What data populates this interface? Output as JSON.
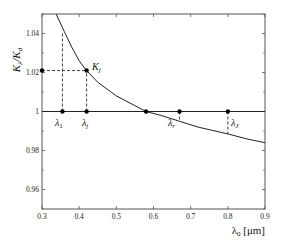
{
  "chart_data": {
    "type": "line",
    "title": "",
    "xlabel": "λ0 [μm]",
    "ylabel": "Kλ/Kd",
    "xlim": [
      0.3,
      0.9
    ],
    "ylim": [
      0.95,
      1.05
    ],
    "grid": false,
    "legend": null,
    "xticks": [
      0.3,
      0.4,
      0.5,
      0.6,
      0.7,
      0.8,
      0.9
    ],
    "xtick_labels": [
      "0.3",
      "0.4",
      "0.5",
      "0.6",
      "0.7",
      "0.8",
      "0.9"
    ],
    "yticks": [
      0.96,
      0.98,
      1.0,
      1.02,
      1.04
    ],
    "ytick_labels": [
      "0.96",
      "0.98",
      "1",
      "1.02",
      "1.04"
    ],
    "series": [
      {
        "name": "Kλ/Kd curve",
        "x": [
          0.338,
          0.36,
          0.38,
          0.4,
          0.42,
          0.45,
          0.5,
          0.55,
          0.58,
          0.62,
          0.67,
          0.72,
          0.8,
          0.85,
          0.9
        ],
        "y": [
          1.05,
          1.041,
          1.033,
          1.026,
          1.021,
          1.015,
          1.008,
          1.003,
          1.0,
          0.998,
          0.995,
          0.992,
          0.9885,
          0.986,
          0.984
        ]
      },
      {
        "name": "reference line y=1",
        "x": [
          0.3,
          0.9
        ],
        "y": [
          1.0,
          1.0
        ]
      }
    ],
    "points": [
      {
        "label": "λ1",
        "x": 0.355,
        "y": 1.0
      },
      {
        "label": "λj",
        "x": 0.42,
        "y": 1.0
      },
      {
        "label": "λr",
        "x": 0.58,
        "y": 1.0
      },
      {
        "label": "",
        "x": 0.67,
        "y": 1.0
      },
      {
        "label": "λJ",
        "x": 0.8,
        "y": 1.0
      },
      {
        "label": "Kj",
        "x": 0.42,
        "y": 1.021
      },
      {
        "label": "",
        "x": 0.3,
        "y": 1.021
      }
    ],
    "annotations": [
      {
        "text": "Kj",
        "at": [
          0.42,
          1.021
        ]
      },
      {
        "text": "λ1",
        "at": [
          0.355,
          1.0
        ]
      },
      {
        "text": "λj",
        "at": [
          0.42,
          1.0
        ]
      },
      {
        "text": "λr",
        "at": [
          0.58,
          1.0
        ]
      },
      {
        "text": "λJ",
        "at": [
          0.8,
          1.0
        ]
      }
    ],
    "dashed_guides": [
      {
        "from": [
          0.355,
          1.0
        ],
        "to": [
          0.355,
          1.041
        ]
      },
      {
        "from": [
          0.42,
          1.0
        ],
        "to": [
          0.42,
          1.021
        ]
      },
      {
        "from": [
          0.3,
          1.021
        ],
        "to": [
          0.42,
          1.021
        ]
      },
      {
        "from": [
          0.67,
          1.0
        ],
        "to": [
          0.67,
          0.995
        ]
      },
      {
        "from": [
          0.8,
          1.0
        ],
        "to": [
          0.8,
          0.9885
        ]
      }
    ]
  },
  "labels": {
    "ylabel_main": "K",
    "ylabel_sub1": "λ",
    "ylabel_slash": "/K",
    "ylabel_sub2": "d",
    "xlabel_main": "λ",
    "xlabel_sub": "0",
    "xlabel_unit": " [μm]",
    "kj_main": "K",
    "kj_sub": "j",
    "lambda_main": "λ",
    "l1_sub": "1",
    "lj_sub": "j",
    "lr_sub": "r",
    "lJ_sub": "J"
  },
  "colors": {
    "axis": "#555555",
    "line": "#222222",
    "marker": "#000000"
  }
}
